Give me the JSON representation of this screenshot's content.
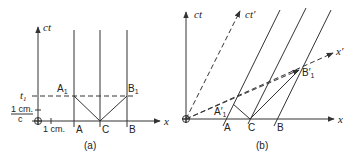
{
  "diagram": {
    "panels": [
      {
        "id": "a",
        "caption": "(a)",
        "axes": {
          "vertical": "ct",
          "horizontal": "x"
        },
        "points": {
          "A": "A",
          "C": "C",
          "B": "B",
          "A1": "A",
          "A1_sub": "1",
          "B1": "B",
          "B1_sub": "1"
        },
        "annotations": {
          "t1": "t",
          "t1_sub": "1",
          "unit_num": "1 cm.",
          "unit_den": "c",
          "x_unit": "1 cm."
        }
      },
      {
        "id": "b",
        "caption": "(b)",
        "axes": {
          "vertical": "ct",
          "horizontal": "x",
          "vertical_prime": "ct′",
          "horizontal_prime": "x′"
        },
        "points": {
          "A": "A",
          "C": "C",
          "B": "B",
          "A1p": "A′",
          "A1p_sub": "1",
          "B1p": "B′",
          "B1p_sub": "1"
        }
      }
    ]
  }
}
